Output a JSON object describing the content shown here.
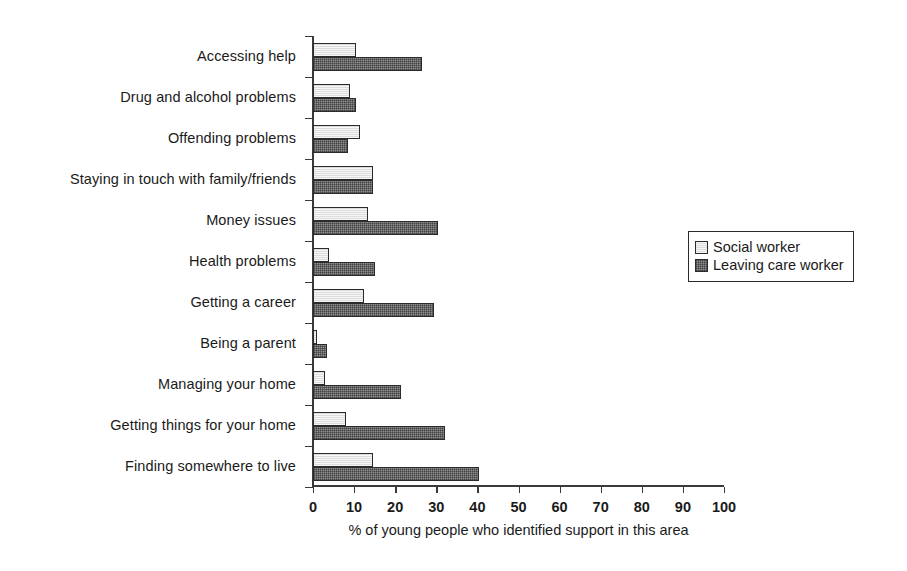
{
  "chart_data": {
    "type": "bar",
    "orientation": "horizontal",
    "title": "",
    "subtitle": "",
    "xlabel": "% of young people who identified support in this area",
    "ylabel": "",
    "xlim": [
      0,
      100
    ],
    "xticks": [
      0,
      10,
      20,
      30,
      40,
      50,
      60,
      70,
      80,
      90,
      100
    ],
    "xtick_labels": [
      "0",
      "10",
      "20",
      "30",
      "40",
      "50",
      "60",
      "70",
      "80",
      "90",
      "100"
    ],
    "grid": false,
    "legend_position": "right",
    "categories": [
      "Accessing help",
      "Drug and alcohol problems",
      "Offending problems",
      "Staying in touch with family/friends",
      "Money issues",
      "Health problems",
      "Getting a career",
      "Being a parent",
      "Managing your home",
      "Getting things for your home",
      "Finding somewhere to live"
    ],
    "series": [
      {
        "name": "Social worker",
        "color": "#dcdcdc",
        "pattern": "light-fill",
        "values": [
          10.5,
          9,
          11.5,
          14.5,
          13.5,
          4,
          12.5,
          1,
          3,
          8,
          14.5
        ]
      },
      {
        "name": "Leaving care worker",
        "color": "#8f8f8f",
        "pattern": "cross-hatch",
        "values": [
          26.5,
          10.5,
          8.5,
          14.5,
          30.5,
          15,
          29.5,
          3.5,
          21.5,
          32,
          40.5
        ]
      }
    ]
  },
  "legend": {
    "items": [
      {
        "label": "Social worker",
        "swatch": "light-swatch"
      },
      {
        "label": "Leaving care worker",
        "swatch": "dark-swatch"
      }
    ]
  },
  "axis": {
    "x_title": "% of young people who identified support in this area"
  }
}
